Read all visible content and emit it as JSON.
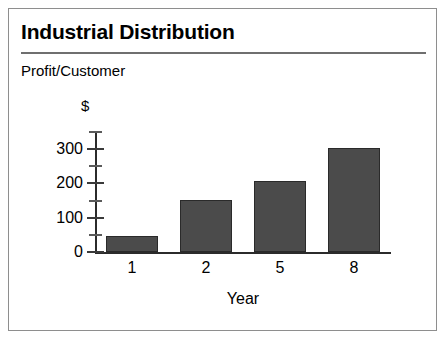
{
  "chart_data": {
    "type": "bar",
    "title": "Industrial Distribution",
    "subtitle": "Profit/Customer",
    "unit_label": "$",
    "categories": [
      "1",
      "2",
      "5",
      "8"
    ],
    "values": [
      48,
      152,
      208,
      303
    ],
    "xlabel": "Year",
    "ylabel": "$",
    "ylim": [
      0,
      350
    ],
    "ytick_labels": [
      "0",
      "100",
      "200",
      "300"
    ],
    "ytick_values": [
      0,
      100,
      200,
      300
    ],
    "yminor_values": [
      50,
      150,
      250,
      350
    ],
    "grid": false,
    "legend": "none",
    "colors": {
      "bar_fill": "#4b4b4b",
      "bar_stroke": "#2a2a2a",
      "axis": "#2b2b2b",
      "rule": "#6f6f6f",
      "frame": "#8e8e8e",
      "background": "#ffffff",
      "text": "#000000"
    }
  }
}
